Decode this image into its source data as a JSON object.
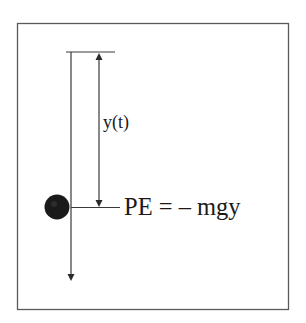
{
  "diagram": {
    "labels": {
      "displacement": "y(t)",
      "equation": "PE = – mgy"
    },
    "colors": {
      "line": "#3a3a3a",
      "border": "#5a5a5a",
      "ball": "#1a1a1a",
      "text": "#1a1a1a",
      "background": "#ffffff"
    }
  }
}
